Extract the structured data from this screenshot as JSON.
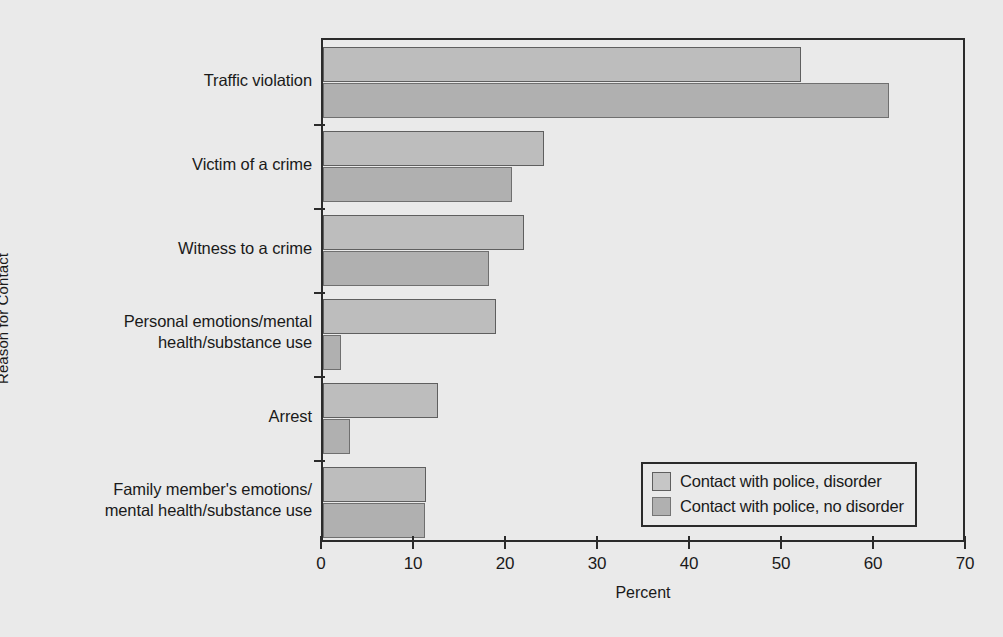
{
  "chart_data": {
    "type": "bar",
    "orientation": "horizontal",
    "title": "",
    "xlabel": "Percent",
    "ylabel": "Reason for Contact",
    "xlim": [
      0,
      70
    ],
    "xticks": [
      0,
      10,
      20,
      30,
      40,
      50,
      60,
      70
    ],
    "xtick_labels": [
      "0",
      "10",
      "20",
      "30",
      "40",
      "50",
      "60",
      "70"
    ],
    "grid": false,
    "legend_position": "lower right",
    "categories": [
      "Traffic violation",
      "Victim of a crime",
      "Witness to a crime",
      "Personal emotions/mental health/substance use",
      "Arrest",
      "Family member's emotions/mental health/substance use"
    ],
    "category_label_lines": [
      [
        "Traffic violation"
      ],
      [
        "Victim of a crime"
      ],
      [
        "Witness to a crime"
      ],
      [
        "Personal emotions/mental",
        "health/substance use"
      ],
      [
        "Arrest"
      ],
      [
        "Family member's emotions/",
        "mental health/substance use"
      ]
    ],
    "series": [
      {
        "name": "Contact with police, disorder",
        "color": "#bdbdbd",
        "values": [
          52.0,
          24.0,
          21.8,
          18.8,
          12.5,
          11.2
        ]
      },
      {
        "name": "Contact with police, no disorder",
        "color": "#b0b0b0",
        "values": [
          61.5,
          20.5,
          18.0,
          2.0,
          2.9,
          11.1
        ]
      }
    ]
  },
  "legend": {
    "entries": [
      "Contact with police, disorder",
      "Contact with police, no disorder"
    ]
  }
}
